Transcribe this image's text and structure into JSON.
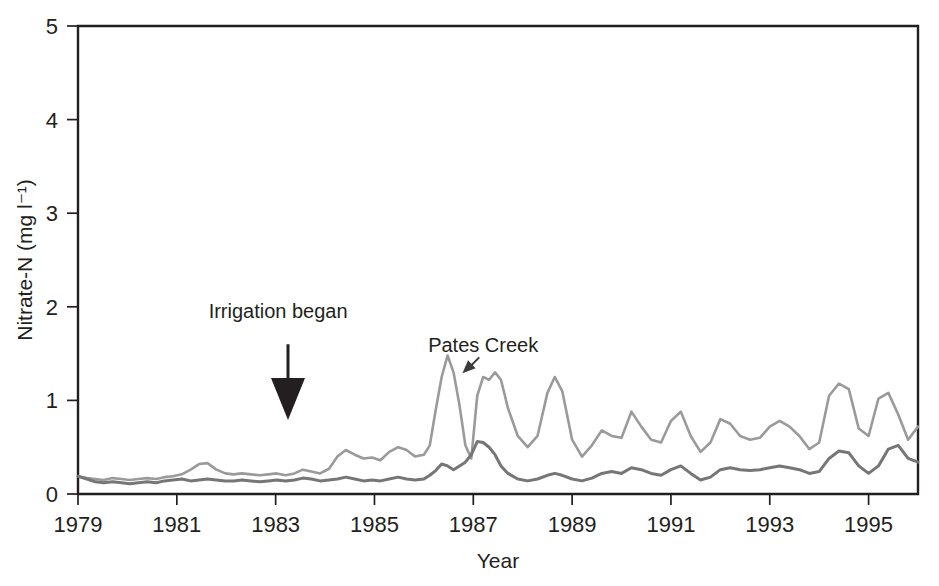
{
  "figure": {
    "background_color": "#ffffff",
    "axis_color": "#231f20"
  },
  "chart_data": {
    "type": "line",
    "title": "",
    "subtitle": "",
    "xlabel": "Year",
    "ylabel": "Nitrate-N (mg l⁻¹)",
    "xlim": [
      1979,
      1996.0
    ],
    "ylim": [
      0,
      5
    ],
    "xticks": [
      1979,
      1981,
      1983,
      1985,
      1987,
      1989,
      1991,
      1993,
      1995
    ],
    "xtick_labels": [
      "1979",
      "1981",
      "1983",
      "1985",
      "1987",
      "1989",
      "1991",
      "1993",
      "1995"
    ],
    "yticks": [
      0,
      1,
      2,
      3,
      4,
      5
    ],
    "ytick_labels": [
      "0",
      "1",
      "2",
      "3",
      "4",
      "5"
    ],
    "grid": false,
    "legend_position": "none",
    "annotations": [
      {
        "name": "irrigation-began",
        "text": "Irrigation began",
        "text_x": 1983.05,
        "text_y": 1.88,
        "arrow_x": 1983.25,
        "arrow_from_y": 1.6,
        "arrow_to_y": 0.79
      },
      {
        "name": "pates-creek",
        "text": "Pates Creek",
        "text_x": 1987.2,
        "text_y": 1.52,
        "arrow_from_x": 1987.12,
        "arrow_from_y": 1.46,
        "arrow_to_x": 1986.78,
        "arrow_to_y": 1.29
      }
    ],
    "series": [
      {
        "name": "Pates Creek",
        "color": "#9a9a9a",
        "stroke_width": 2.6,
        "x": [
          1979.0,
          1979.18,
          1979.35,
          1979.52,
          1979.7,
          1979.88,
          1980.05,
          1980.22,
          1980.4,
          1980.58,
          1980.75,
          1980.92,
          1981.1,
          1981.28,
          1981.45,
          1981.62,
          1981.8,
          1981.98,
          1982.15,
          1982.32,
          1982.5,
          1982.68,
          1982.85,
          1983.02,
          1983.2,
          1983.38,
          1983.55,
          1983.72,
          1983.9,
          1984.08,
          1984.25,
          1984.42,
          1984.6,
          1984.78,
          1984.95,
          1985.12,
          1985.3,
          1985.48,
          1985.65,
          1985.82,
          1986.0,
          1986.12,
          1986.24,
          1986.36,
          1986.48,
          1986.6,
          1986.72,
          1986.84,
          1986.96,
          1987.08,
          1987.2,
          1987.32,
          1987.44,
          1987.56,
          1987.7,
          1987.9,
          1988.1,
          1988.3,
          1988.5,
          1988.65,
          1988.8,
          1989.0,
          1989.2,
          1989.4,
          1989.6,
          1989.8,
          1990.0,
          1990.2,
          1990.4,
          1990.6,
          1990.8,
          1991.0,
          1991.2,
          1991.4,
          1991.6,
          1991.8,
          1992.0,
          1992.2,
          1992.4,
          1992.6,
          1992.8,
          1993.0,
          1993.2,
          1993.4,
          1993.6,
          1993.8,
          1994.0,
          1994.2,
          1994.4,
          1994.6,
          1994.8,
          1995.0,
          1995.2,
          1995.4,
          1995.6,
          1995.8,
          1996.0
        ],
        "values": [
          0.19,
          0.17,
          0.16,
          0.15,
          0.17,
          0.16,
          0.15,
          0.16,
          0.17,
          0.16,
          0.18,
          0.19,
          0.21,
          0.26,
          0.32,
          0.33,
          0.26,
          0.22,
          0.21,
          0.22,
          0.21,
          0.2,
          0.21,
          0.22,
          0.2,
          0.22,
          0.26,
          0.24,
          0.22,
          0.27,
          0.4,
          0.47,
          0.42,
          0.38,
          0.39,
          0.36,
          0.45,
          0.5,
          0.47,
          0.4,
          0.42,
          0.52,
          0.9,
          1.25,
          1.48,
          1.3,
          0.95,
          0.52,
          0.38,
          1.05,
          1.25,
          1.22,
          1.3,
          1.22,
          0.92,
          0.62,
          0.5,
          0.62,
          1.08,
          1.25,
          1.1,
          0.58,
          0.4,
          0.52,
          0.68,
          0.62,
          0.6,
          0.88,
          0.72,
          0.58,
          0.55,
          0.78,
          0.88,
          0.62,
          0.45,
          0.55,
          0.8,
          0.75,
          0.62,
          0.58,
          0.6,
          0.72,
          0.78,
          0.72,
          0.62,
          0.48,
          0.55,
          1.05,
          1.18,
          1.12,
          0.7,
          0.62,
          1.02,
          1.08,
          0.85,
          0.58,
          0.72
        ]
      },
      {
        "name": "Second stream",
        "color": "#767676",
        "stroke_width": 3.0,
        "x": [
          1979.0,
          1979.18,
          1979.35,
          1979.52,
          1979.7,
          1979.88,
          1980.05,
          1980.22,
          1980.4,
          1980.58,
          1980.75,
          1980.92,
          1981.1,
          1981.28,
          1981.45,
          1981.62,
          1981.8,
          1981.98,
          1982.15,
          1982.32,
          1982.5,
          1982.68,
          1982.85,
          1983.02,
          1983.2,
          1983.38,
          1983.55,
          1983.72,
          1983.9,
          1984.08,
          1984.25,
          1984.42,
          1984.6,
          1984.78,
          1984.95,
          1985.12,
          1985.3,
          1985.48,
          1985.65,
          1985.82,
          1986.0,
          1986.12,
          1986.24,
          1986.36,
          1986.48,
          1986.6,
          1986.72,
          1986.84,
          1986.96,
          1987.08,
          1987.2,
          1987.32,
          1987.44,
          1987.56,
          1987.7,
          1987.9,
          1988.1,
          1988.3,
          1988.5,
          1988.65,
          1988.8,
          1989.0,
          1989.2,
          1989.4,
          1989.6,
          1989.8,
          1990.0,
          1990.2,
          1990.4,
          1990.6,
          1990.8,
          1991.0,
          1991.2,
          1991.4,
          1991.6,
          1991.8,
          1992.0,
          1992.2,
          1992.4,
          1992.6,
          1992.8,
          1993.0,
          1993.2,
          1993.4,
          1993.6,
          1993.8,
          1994.0,
          1994.2,
          1994.4,
          1994.6,
          1994.8,
          1995.0,
          1995.2,
          1995.4,
          1995.6,
          1995.8,
          1996.0
        ],
        "values": [
          0.19,
          0.16,
          0.13,
          0.12,
          0.13,
          0.12,
          0.11,
          0.12,
          0.13,
          0.12,
          0.14,
          0.15,
          0.16,
          0.14,
          0.15,
          0.16,
          0.15,
          0.14,
          0.14,
          0.15,
          0.14,
          0.13,
          0.14,
          0.15,
          0.14,
          0.15,
          0.17,
          0.16,
          0.14,
          0.15,
          0.16,
          0.18,
          0.16,
          0.14,
          0.15,
          0.14,
          0.16,
          0.18,
          0.16,
          0.15,
          0.16,
          0.2,
          0.25,
          0.32,
          0.3,
          0.26,
          0.3,
          0.34,
          0.42,
          0.56,
          0.55,
          0.5,
          0.42,
          0.3,
          0.22,
          0.16,
          0.14,
          0.16,
          0.2,
          0.22,
          0.2,
          0.16,
          0.14,
          0.17,
          0.22,
          0.24,
          0.22,
          0.28,
          0.26,
          0.22,
          0.2,
          0.26,
          0.3,
          0.22,
          0.15,
          0.18,
          0.26,
          0.28,
          0.26,
          0.25,
          0.26,
          0.28,
          0.3,
          0.28,
          0.26,
          0.22,
          0.24,
          0.38,
          0.46,
          0.44,
          0.3,
          0.22,
          0.3,
          0.48,
          0.52,
          0.38,
          0.34
        ]
      }
    ]
  }
}
